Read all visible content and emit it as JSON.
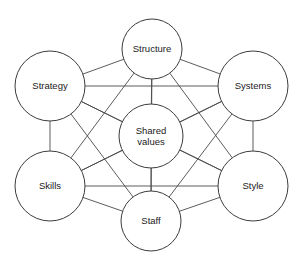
{
  "diagram": {
    "type": "node-link-diagram",
    "background_color": "#ffffff",
    "line_color": "#4a4a4a",
    "node_fill_color": "#ffffff",
    "node_stroke_color": "#3c3c3c",
    "text_color": "#1a1a1a",
    "canvas": {
      "width": 302,
      "height": 269
    },
    "nodes": [
      {
        "id": "structure",
        "label": "Structure",
        "lines": [
          "Structure"
        ],
        "cx": 152,
        "cy": 49,
        "r": 30
      },
      {
        "id": "strategy",
        "label": "Strategy",
        "lines": [
          "Strategy"
        ],
        "cx": 50,
        "cy": 86,
        "r": 35
      },
      {
        "id": "systems",
        "label": "Systems",
        "lines": [
          "Systems"
        ],
        "cx": 253,
        "cy": 86,
        "r": 35
      },
      {
        "id": "shared_values",
        "label": "Shared values",
        "lines": [
          "Shared",
          "values"
        ],
        "cx": 151,
        "cy": 136,
        "r": 32
      },
      {
        "id": "skills",
        "label": "Skills",
        "lines": [
          "Skills"
        ],
        "cx": 50,
        "cy": 186,
        "r": 35
      },
      {
        "id": "style",
        "label": "Style",
        "lines": [
          "Style"
        ],
        "cx": 253,
        "cy": 186,
        "r": 35
      },
      {
        "id": "staff",
        "label": "Staff",
        "lines": [
          "Staff"
        ],
        "cx": 151,
        "cy": 221,
        "r": 30
      }
    ],
    "edges": [
      {
        "from": "structure",
        "to": "strategy"
      },
      {
        "from": "structure",
        "to": "systems"
      },
      {
        "from": "structure",
        "to": "shared_values"
      },
      {
        "from": "structure",
        "to": "skills"
      },
      {
        "from": "structure",
        "to": "style"
      },
      {
        "from": "structure",
        "to": "staff"
      },
      {
        "from": "strategy",
        "to": "systems"
      },
      {
        "from": "strategy",
        "to": "shared_values"
      },
      {
        "from": "strategy",
        "to": "skills"
      },
      {
        "from": "strategy",
        "to": "style"
      },
      {
        "from": "strategy",
        "to": "staff"
      },
      {
        "from": "systems",
        "to": "shared_values"
      },
      {
        "from": "systems",
        "to": "skills"
      },
      {
        "from": "systems",
        "to": "style"
      },
      {
        "from": "systems",
        "to": "staff"
      },
      {
        "from": "shared_values",
        "to": "skills"
      },
      {
        "from": "shared_values",
        "to": "style"
      },
      {
        "from": "shared_values",
        "to": "staff"
      },
      {
        "from": "skills",
        "to": "style"
      },
      {
        "from": "skills",
        "to": "staff"
      },
      {
        "from": "style",
        "to": "staff"
      }
    ]
  }
}
